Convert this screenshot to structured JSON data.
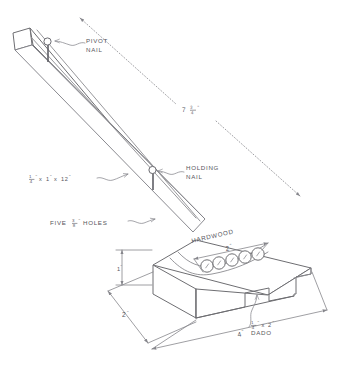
{
  "drawing": {
    "title": "Nail-pivot drilling jig woodworking plan",
    "ink_color": "#6e6e72",
    "background_color": "#ffffff"
  },
  "annotations": {
    "pivot_nail": {
      "line1": "PIVOT",
      "line2": "NAIL"
    },
    "holding_nail": {
      "line1": "HOLDING",
      "line2": "NAIL"
    },
    "hardwood": "HARDWOOD",
    "holes_note": {
      "prefix": "FIVE",
      "fraction_num": "3",
      "fraction_den": "8",
      "inch_mark": "\"",
      "suffix": "HOLES"
    },
    "dado_note": {
      "fraction_num": "1",
      "fraction_den": "4",
      "inch_mark": "\"",
      "times": "x",
      "width": "2",
      "width_inch_mark": "\"",
      "line2": "DADO"
    }
  },
  "dimensions": {
    "arm_stock": {
      "thickness_num": "1",
      "thickness_den": "4",
      "inch_mark": "\"",
      "times1": "x",
      "width": "1",
      "width_inch_mark": "\"",
      "times2": "x",
      "length": "12",
      "length_inch_mark": "\""
    },
    "arm_span": {
      "whole": "7",
      "frac_num": "3",
      "frac_den": "4",
      "inch_mark": "\""
    },
    "hole_row_span": {
      "value": "2",
      "inch_mark": "\""
    },
    "block_height": {
      "value": "2",
      "inch_mark": "\""
    },
    "block_side_height": {
      "value": "1",
      "inch_mark": "\""
    },
    "block_width": {
      "value": "4",
      "inch_mark": "\""
    }
  },
  "holes": {
    "count": 5,
    "radius": 6.2,
    "centers": [
      {
        "cx": 207,
        "cy": 266
      },
      {
        "cx": 219,
        "cy": 263
      },
      {
        "cx": 232,
        "cy": 260
      },
      {
        "cx": 245,
        "cy": 257
      },
      {
        "cx": 258,
        "cy": 254
      }
    ]
  }
}
